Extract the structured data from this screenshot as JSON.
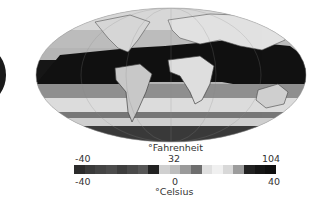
{
  "map": {
    "projection": "Mollweide",
    "description": "Global surface temperature map (grayscale)"
  },
  "legend": {
    "top_unit": "°Fahrenheit",
    "bottom_unit": "°Celsius",
    "fahrenheit_ticks": {
      "min": "-40",
      "mid": "32",
      "max": "104"
    },
    "celsius_ticks": {
      "min": "-40",
      "mid": "0",
      "max": "40"
    },
    "colorbar_segments": [
      "#2b2b2b",
      "#3a3a3a",
      "#444444",
      "#4c4c4c",
      "#3d3d3d",
      "#4a4a4a",
      "#575757",
      "#222222",
      "#d0d0d0",
      "#bdbdbd",
      "#9a9a9a",
      "#6e6e6e",
      "#e0e0e0",
      "#f0f0f0",
      "#d8d8d8",
      "#9c9c9c",
      "#222222",
      "#151515",
      "#0e0e0e"
    ]
  }
}
